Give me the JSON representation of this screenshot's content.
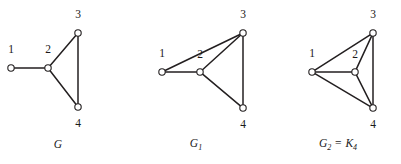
{
  "figure": {
    "width": 401,
    "height": 164,
    "background_color": "#ffffff",
    "ink_color": "#231f20"
  },
  "chart_data": {
    "type": "diagram",
    "title": "",
    "subtype": "graph-node-link",
    "panels": [
      {
        "id": "G",
        "caption": "G",
        "caption_base": "G",
        "caption_sub": "",
        "caption_tail": "",
        "caption_x": 58,
        "caption_y": 145,
        "panel_x": 0,
        "vertices": [
          {
            "id": "1",
            "label": "1",
            "cx": 11,
            "cy": 68,
            "r": 3.2,
            "label_x": 11,
            "label_y": 50
          },
          {
            "id": "2",
            "label": "2",
            "cx": 48,
            "cy": 68,
            "r": 3.2,
            "label_x": 48,
            "label_y": 50
          },
          {
            "id": "3",
            "label": "3",
            "cx": 78,
            "cy": 33,
            "r": 3.2,
            "label_x": 78,
            "label_y": 15
          },
          {
            "id": "4",
            "label": "4",
            "cx": 78,
            "cy": 107,
            "r": 3.2,
            "label_x": 78,
            "label_y": 124
          }
        ],
        "edges": [
          {
            "from": "1",
            "to": "2"
          },
          {
            "from": "2",
            "to": "3"
          },
          {
            "from": "2",
            "to": "4"
          },
          {
            "from": "3",
            "to": "4"
          }
        ],
        "edge_count": 4
      },
      {
        "id": "G1",
        "caption": "G1",
        "caption_base": "G",
        "caption_sub": "1",
        "caption_tail": "",
        "caption_x": 196,
        "caption_y": 145,
        "panel_x": 0,
        "vertices": [
          {
            "id": "1",
            "label": "1",
            "cx": 162,
            "cy": 72,
            "r": 3.2,
            "label_x": 162,
            "label_y": 54
          },
          {
            "id": "2",
            "label": "2",
            "cx": 200,
            "cy": 72,
            "r": 3.2,
            "label_x": 200,
            "label_y": 55
          },
          {
            "id": "3",
            "label": "3",
            "cx": 243,
            "cy": 33,
            "r": 3.2,
            "label_x": 243,
            "label_y": 15
          },
          {
            "id": "4",
            "label": "4",
            "cx": 243,
            "cy": 108,
            "r": 3.2,
            "label_x": 243,
            "label_y": 125
          }
        ],
        "edges": [
          {
            "from": "1",
            "to": "2"
          },
          {
            "from": "1",
            "to": "3"
          },
          {
            "from": "2",
            "to": "3"
          },
          {
            "from": "2",
            "to": "4"
          },
          {
            "from": "3",
            "to": "4"
          }
        ],
        "edge_count": 5
      },
      {
        "id": "G2",
        "caption": "G2 = K4",
        "caption_base": "G",
        "caption_sub": "2",
        "caption_tail": "K",
        "caption_tail_sub": "4",
        "caption_eq": "=",
        "caption_x": 338,
        "caption_y": 145,
        "panel_x": 0,
        "vertices": [
          {
            "id": "1",
            "label": "1",
            "cx": 312,
            "cy": 72,
            "r": 3.2,
            "label_x": 312,
            "label_y": 54
          },
          {
            "id": "2",
            "label": "2",
            "cx": 355,
            "cy": 72,
            "r": 3.2,
            "label_x": 355,
            "label_y": 55
          },
          {
            "id": "3",
            "label": "3",
            "cx": 373,
            "cy": 33,
            "r": 3.2,
            "label_x": 373,
            "label_y": 15
          },
          {
            "id": "4",
            "label": "4",
            "cx": 373,
            "cy": 108,
            "r": 3.2,
            "label_x": 373,
            "label_y": 125
          }
        ],
        "edges": [
          {
            "from": "1",
            "to": "2"
          },
          {
            "from": "1",
            "to": "3"
          },
          {
            "from": "1",
            "to": "4"
          },
          {
            "from": "2",
            "to": "3"
          },
          {
            "from": "2",
            "to": "4"
          },
          {
            "from": "3",
            "to": "4"
          }
        ],
        "edge_count": 6
      }
    ]
  }
}
